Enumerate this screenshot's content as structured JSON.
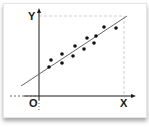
{
  "chart_data": {
    "type": "scatter",
    "title": "",
    "xlabel": "X",
    "ylabel": "Y",
    "origin_label": "O",
    "grid": false,
    "legend": null,
    "points": [
      {
        "x": 10,
        "y": 29
      },
      {
        "x": 12,
        "y": 36
      },
      {
        "x": 23,
        "y": 33
      },
      {
        "x": 23,
        "y": 42
      },
      {
        "x": 34,
        "y": 40
      },
      {
        "x": 36,
        "y": 50
      },
      {
        "x": 45,
        "y": 47
      },
      {
        "x": 48,
        "y": 58
      },
      {
        "x": 55,
        "y": 53
      },
      {
        "x": 57,
        "y": 60
      },
      {
        "x": 65,
        "y": 69
      },
      {
        "x": 77,
        "y": 68
      }
    ],
    "trend_line": {
      "x1": -18,
      "y1": 10,
      "x2": 88,
      "y2": 80
    },
    "guide_lines": {
      "top_y": 80,
      "right_x": 85,
      "style": "dashed"
    },
    "units": "pixel offsets from origin (unitless diagram)"
  },
  "colors": {
    "axis": "#1a1a1a",
    "points": "#111111",
    "trend_line": "#666666",
    "guides": "#cfcfcf",
    "background": "#ffffff"
  }
}
